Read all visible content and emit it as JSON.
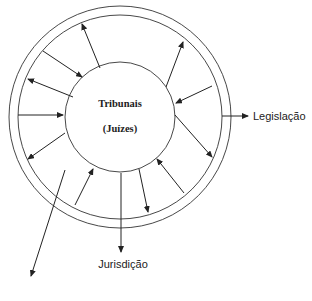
{
  "diagram": {
    "center": {
      "title": "Tribunais",
      "subtitle": "(Juízes)"
    },
    "labels": {
      "right": "Legislação",
      "bottom": "Jurisdição"
    },
    "colors": {
      "stroke": "#222222",
      "background": "#ffffff"
    },
    "circles": [
      {
        "name": "outer-ring",
        "cx": 120,
        "cy": 117,
        "r": 111
      },
      {
        "name": "inner-ring",
        "cx": 120,
        "cy": 117,
        "r": 102
      },
      {
        "name": "core",
        "cx": 120,
        "cy": 117,
        "r": 55
      }
    ],
    "arrows": [
      {
        "name": "arrow-outward-1",
        "x1": 100,
        "y1": 68,
        "x2": 82,
        "y2": 24
      },
      {
        "name": "arrow-inward-2",
        "x1": 43,
        "y1": 51,
        "x2": 82,
        "y2": 77
      },
      {
        "name": "arrow-outward-3",
        "x1": 73,
        "y1": 97,
        "x2": 28,
        "y2": 79
      },
      {
        "name": "arrow-inward-4",
        "x1": 18,
        "y1": 115,
        "x2": 63,
        "y2": 115
      },
      {
        "name": "arrow-outward-5",
        "x1": 65,
        "y1": 133,
        "x2": 28,
        "y2": 159
      },
      {
        "name": "arrow-inward-6",
        "x1": 75,
        "y1": 205,
        "x2": 93,
        "y2": 169
      },
      {
        "name": "arrow-jurisdicao",
        "x1": 121,
        "y1": 173,
        "x2": 121,
        "y2": 252
      },
      {
        "name": "arrow-outward-8",
        "x1": 139,
        "y1": 169,
        "x2": 148,
        "y2": 212
      },
      {
        "name": "arrow-inward-9",
        "x1": 184,
        "y1": 193,
        "x2": 157,
        "y2": 159
      },
      {
        "name": "arrow-outward-10",
        "x1": 175,
        "y1": 115,
        "x2": 212,
        "y2": 157
      },
      {
        "name": "arrow-inward-11",
        "x1": 212,
        "y1": 86,
        "x2": 176,
        "y2": 103
      },
      {
        "name": "arrow-outward-12",
        "x1": 166,
        "y1": 87,
        "x2": 183,
        "y2": 42
      },
      {
        "name": "arrow-legislacao",
        "x1": 222,
        "y1": 116,
        "x2": 248,
        "y2": 116
      },
      {
        "name": "arrow-long-outward",
        "x1": 65,
        "y1": 170,
        "x2": 31,
        "y2": 276
      }
    ]
  }
}
